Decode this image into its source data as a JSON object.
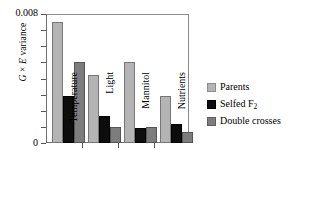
{
  "chart_data": {
    "type": "bar",
    "title": "",
    "xlabel": "",
    "ylabel": "G × E variance",
    "ylabel_parts": {
      "g": "G",
      "times": " × ",
      "e": "E",
      "rest": " variance"
    },
    "categories": [
      "Temperature",
      "Light",
      "Mannitol",
      "Nutrients"
    ],
    "series": [
      {
        "name": "Parents",
        "color": "#b4b4b4",
        "values": [
          0.0075,
          0.0042,
          0.005,
          0.0029
        ]
      },
      {
        "name": "Selfed F2",
        "color": "#0d0d0d",
        "values": [
          0.0029,
          0.0017,
          0.0009,
          0.0012
        ]
      },
      {
        "name": "Double crosses",
        "color": "#7d7d7d",
        "values": [
          0.005,
          0.001,
          0.001,
          0.0007
        ]
      }
    ],
    "ylim": [
      0,
      0.008
    ],
    "ytick_values": [
      0,
      0.001,
      0.002,
      0.003,
      0.004,
      0.005,
      0.006,
      0.007,
      0.008
    ],
    "ytick_labels_shown": {
      "top": "0.008",
      "zero": "0"
    },
    "grid": false,
    "legend_position": "right",
    "legend": [
      {
        "label": "Parents",
        "sub": "",
        "swatch": "#b4b4b4"
      },
      {
        "label": "Selfed F",
        "sub": "2",
        "swatch": "#0d0d0d"
      },
      {
        "label": "Double crosses",
        "sub": "",
        "swatch": "#7d7d7d"
      }
    ]
  },
  "axis": {
    "y_top_label": "0.008",
    "y_zero_label": "0"
  },
  "legend": {
    "parents": "Parents",
    "selfed_main": "Selfed F",
    "selfed_sub": "2",
    "double": "Double crosses"
  },
  "categories": {
    "c0": "Temperature",
    "c1": "Light",
    "c2": "Mannitol",
    "c3": "Nutrients"
  },
  "ylabel": {
    "g": "G",
    "times": "×",
    "e": "E",
    "variance": "variance"
  }
}
